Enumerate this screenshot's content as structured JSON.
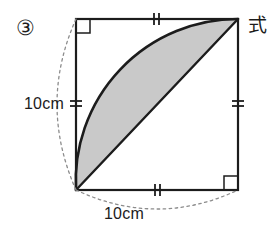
{
  "figure": {
    "problem_number": "③",
    "formula_label": "式",
    "side_label_left": "10cm",
    "side_label_bottom": "10cm",
    "colors": {
      "shaded_region": "#c9c9c9",
      "stroke": "#1c1c1c",
      "dotted_guide": "#8c8c8c",
      "background": "#ffffff"
    },
    "geometry": {
      "square": {
        "x": 76,
        "y": 19,
        "size": 162
      },
      "arc_center": "top-left",
      "arc_radius": 162,
      "diagonal_from": "bottom-left",
      "diagonal_to": "top-right",
      "right_angle_marks": [
        "top-left",
        "bottom-right"
      ],
      "tick_marks": {
        "count_per_edge": 2,
        "edges": [
          "top",
          "right",
          "bottom",
          "left"
        ]
      },
      "dotted_arcs": [
        "left-outer",
        "bottom-outer"
      ]
    }
  }
}
